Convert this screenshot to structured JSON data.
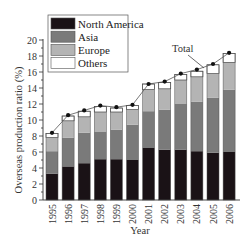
{
  "chart_data": {
    "type": "bar",
    "stacked": true,
    "title": "",
    "xlabel": "Year",
    "ylabel": "Overseas production ratio (%)",
    "ylim": [
      0,
      20
    ],
    "yticks": [
      0,
      2,
      4,
      6,
      8,
      10,
      12,
      14,
      16,
      18,
      20
    ],
    "grid": false,
    "legend_position": "upper-left",
    "categories": [
      "1995",
      "1996",
      "1997",
      "1998",
      "1999",
      "2000",
      "2001",
      "2002",
      "2003",
      "2004",
      "2005",
      "2006"
    ],
    "series": [
      {
        "name": "North America",
        "color": "#1a1216",
        "values": [
          3.3,
          4.2,
          4.6,
          5.1,
          5.1,
          5.0,
          6.5,
          6.3,
          6.3,
          6.1,
          5.9,
          6.0
        ]
      },
      {
        "name": "Asia",
        "color": "#7a7a7a",
        "values": [
          2.8,
          3.6,
          3.8,
          3.4,
          3.7,
          4.4,
          4.6,
          5.0,
          5.7,
          6.2,
          6.9,
          7.8
        ]
      },
      {
        "name": "Europe",
        "color": "#b4b4b4",
        "values": [
          1.7,
          2.1,
          2.0,
          2.5,
          2.2,
          1.9,
          2.7,
          2.6,
          3.0,
          3.1,
          3.0,
          3.4
        ]
      },
      {
        "name": "Others",
        "color": "#ffffff",
        "values": [
          0.5,
          0.6,
          0.7,
          0.7,
          0.5,
          0.5,
          0.7,
          0.8,
          0.7,
          0.7,
          1.1,
          1.1
        ]
      }
    ],
    "line_series": {
      "name": "Total",
      "type": "line",
      "marker": "circle",
      "values": [
        8.4,
        10.6,
        11.2,
        11.8,
        11.6,
        11.9,
        14.5,
        14.8,
        15.8,
        16.3,
        17.0,
        18.4
      ]
    },
    "annotations": [
      {
        "text": "Total",
        "points_to": "Total line between 2004 and 2005"
      }
    ]
  },
  "labels": {
    "xlabel": "Year",
    "ylabel": "Overseas production ratio (%)",
    "total_annotation": "Total"
  }
}
